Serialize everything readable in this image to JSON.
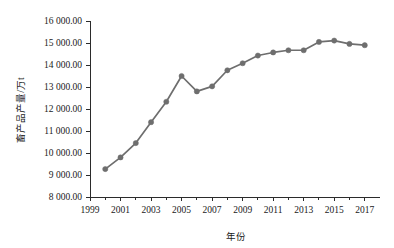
{
  "chart_data": {
    "type": "line",
    "title": "",
    "xlabel": "年份",
    "ylabel": "畜产品产量/万t",
    "x": [
      2000,
      2001,
      2002,
      2003,
      2004,
      2005,
      2006,
      2007,
      2008,
      2009,
      2010,
      2011,
      2012,
      2013,
      2014,
      2015,
      2016,
      2017
    ],
    "values": [
      9270,
      9800,
      10450,
      11400,
      12330,
      13500,
      12800,
      13030,
      13760,
      14080,
      14430,
      14570,
      14670,
      14670,
      15050,
      15110,
      14960,
      14900
    ],
    "series": [
      {
        "name": "畜产品产量",
        "values": [
          9270,
          9800,
          10450,
          11400,
          12330,
          13500,
          12800,
          13030,
          13760,
          14080,
          14430,
          14570,
          14670,
          14670,
          15050,
          15110,
          14960,
          14900
        ]
      }
    ],
    "xlim": [
      1999,
      2018
    ],
    "ylim": [
      8000,
      16000
    ],
    "ytick_labels": [
      "16 000.00",
      "15 000.00",
      "14 000.00",
      "13 000.00",
      "12 000.00",
      "11 000.00",
      "10 000.00",
      "9 000.00",
      "8 000.00"
    ],
    "ytick_values": [
      16000,
      15000,
      14000,
      13000,
      12000,
      11000,
      10000,
      9000,
      8000
    ],
    "xtick_labels": [
      "1999",
      "2001",
      "2003",
      "2005",
      "2007",
      "2009",
      "2011",
      "2013",
      "2015",
      "2017"
    ],
    "xtick_values": [
      1999,
      2001,
      2003,
      2005,
      2007,
      2009,
      2011,
      2013,
      2015,
      2017
    ],
    "grid": false,
    "legend": "none",
    "series_color": "#6e6e6e",
    "axis_color": "#2b2b2b",
    "background": "#ffffff"
  }
}
